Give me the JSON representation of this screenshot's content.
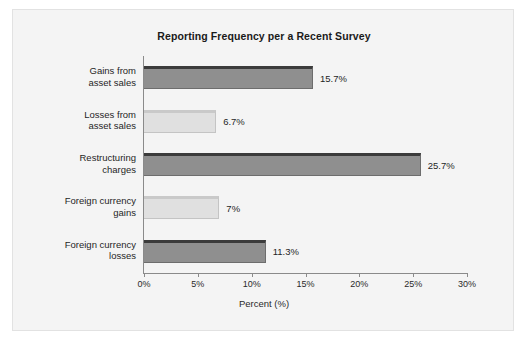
{
  "figure": {
    "background_color": "#f4f4f4",
    "border_color": "#e2e2e2"
  },
  "chart_data": {
    "type": "bar",
    "orientation": "horizontal",
    "title": "Reporting Frequency per a Recent Survey",
    "xlabel": "Percent (%)",
    "ylabel": "",
    "categories": [
      "Gains from\nasset sales",
      "Losses from\nasset sales",
      "Restructuring\ncharges",
      "Foreign currency\ngains",
      "Foreign currency\nlosses"
    ],
    "values": [
      15.7,
      6.7,
      25.7,
      7,
      11.3
    ],
    "value_labels": [
      "15.7%",
      "6.7%",
      "25.7%",
      "7%",
      "11.3%"
    ],
    "bar_styles": [
      "dark",
      "light",
      "dark",
      "light",
      "dark"
    ],
    "bar_colors": {
      "dark": "#8f8f8f",
      "dark_top": "#3b3b3b",
      "light": "#e0e0e0",
      "light_top": "#c9c9c9"
    },
    "xlim": [
      0,
      30
    ],
    "xticks": [
      0,
      5,
      10,
      15,
      20,
      25,
      30
    ],
    "xtick_labels": [
      "0%",
      "5%",
      "10%",
      "15%",
      "20%",
      "25%",
      "30%"
    ],
    "grid": false,
    "legend": null
  }
}
